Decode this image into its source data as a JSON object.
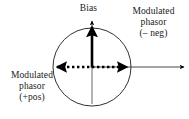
{
  "figure": {
    "type": "phasor-diagram",
    "background_color": "#ffffff",
    "stroke_color": "#000000",
    "axis_color": "#4d4d4d"
  },
  "labels": {
    "bias": "Bias",
    "modulated_phasor_neg": {
      "line1": "Modulated",
      "line2": "phasor",
      "line3": "(– neg)"
    },
    "modulated_phasor_pos": {
      "line1": "Modulated",
      "line2": "phasor",
      "line3": "(+pos)"
    }
  },
  "geometry": {
    "circle": {
      "cx": 92,
      "cy": 67,
      "r": 39
    },
    "vertical_axis": {
      "x": 92,
      "y_top": 19,
      "y_bottom": 104
    },
    "horizontal_axis": {
      "y": 67,
      "x_start": 92,
      "x_end": 186
    },
    "bias_phasor": {
      "x": 92,
      "y_start": 67,
      "y_end": 25
    },
    "modulation_arrow": {
      "y": 67,
      "x_left": 53,
      "x_right": 131
    }
  }
}
